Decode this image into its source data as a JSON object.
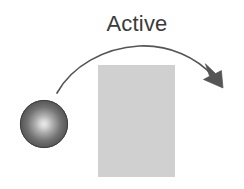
{
  "figure": {
    "width": 244,
    "height": 189,
    "background_color": "#ffffff",
    "caption": {
      "text": "Active",
      "color": "#3b3b3b",
      "font_size_px": 22
    },
    "sphere": {
      "name": "sphere",
      "center_x": 44,
      "center_y": 124,
      "radius": 24,
      "highlight_color": "#d2d2d2",
      "mid_color": "#8c8c8c",
      "edge_color": "#4f4f4f",
      "outline_color": "#3f3f3f"
    },
    "rectangle": {
      "name": "gray-rectangle",
      "x": 98,
      "y": 65,
      "width": 77,
      "height": 112,
      "fill_color": "#d0d0d0"
    },
    "arrow": {
      "name": "curved-arrow",
      "stroke_color": "#555555",
      "stroke_width": 1.6,
      "start_x": 57,
      "start_y": 93,
      "apex_x": 145,
      "apex_y": 46,
      "tip_x": 223,
      "tip_y": 88,
      "head_fill_color": "#555555",
      "direction": "left-to-right-descending"
    }
  }
}
